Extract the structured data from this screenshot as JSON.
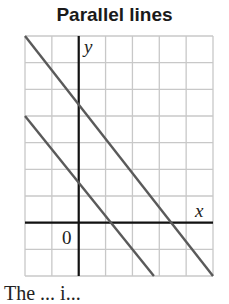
{
  "title": "Parallel lines",
  "caption": "The ... i...",
  "axes": {
    "x_label": "x",
    "y_label": "y",
    "origin_label": "0",
    "x_range": [
      -2,
      5
    ],
    "y_range": [
      -2,
      7
    ],
    "grid": true
  },
  "colors": {
    "grid": "#c8c8c8",
    "axis": "#111111",
    "line": "#5a5a5a"
  },
  "chart_data": {
    "type": "line",
    "title": "Parallel lines",
    "xlabel": "x",
    "ylabel": "y",
    "xlim": [
      -2,
      5
    ],
    "ylim": [
      -2,
      7
    ],
    "grid": true,
    "series": [
      {
        "name": "upper line",
        "points": [
          [
            -2,
            7
          ],
          [
            0,
            4.4
          ],
          [
            3.4,
            0
          ],
          [
            5,
            -2
          ]
        ]
      },
      {
        "name": "lower line",
        "points": [
          [
            -2,
            4
          ],
          [
            0,
            1.65
          ],
          [
            1.3,
            0
          ],
          [
            2.8,
            -2
          ]
        ]
      }
    ]
  }
}
